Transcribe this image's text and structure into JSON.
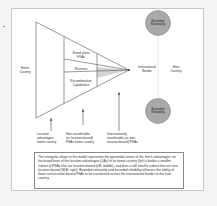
{
  "diagram": {
    "left_region": {
      "label_line1": "Home",
      "label_line2": "Country"
    },
    "triangle_sections": [
      {
        "line1": "Stand-alone",
        "line2": "FSAs"
      },
      {
        "line1": "Routines",
        "line2": ""
      },
      {
        "line1": "Recombination",
        "line2": "Capabilities"
      }
    ],
    "border_label": {
      "line1": "International",
      "line2": "Border"
    },
    "host_label": {
      "line1": "Host",
      "line2": "Country"
    },
    "circles": [
      {
        "line1": "Bounded",
        "line2": "Rationality",
        "color": "#a9a9a9"
      },
      {
        "line1": "Bounded",
        "line2": "Reliability",
        "color": "#a9a9a9"
      }
    ],
    "bottom_labels": [
      {
        "line1": "Location",
        "line2": "advantages",
        "line3": "home country"
      },
      {
        "line1": "Non-transferable",
        "line2": "(or location-bound)",
        "line3": "FSAs home country"
      },
      {
        "line1": "Internationally",
        "line2": "transferable (or non-",
        "line3": "location-bound) FSAs"
      }
    ],
    "caption": "The triangular shape in the model represents the pyramidal nature of the firm's advantages: on the broad base of the location advantages (LAs) of its home country (left) it builds a smaller subset of FSAs that are location-bound (LB; middle), and then a still smaller subset that are non-location-bound (NLB; right). Bounded rationality and bounded reliability influence the ability of those non-location-bound FSAs to be transferred across the international border to the host country.",
    "colors": {
      "shaded_wedge": "#d4d4d4",
      "line": "#555555",
      "dotted_border": "#aaaaaa"
    }
  }
}
